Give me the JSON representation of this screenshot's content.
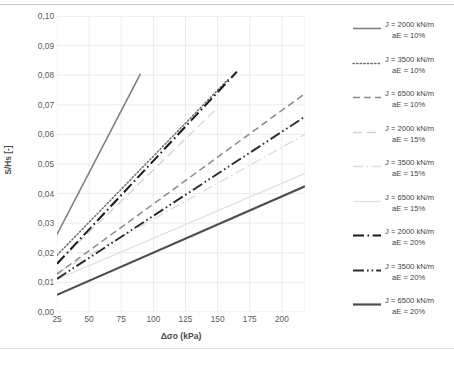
{
  "chart_data": {
    "type": "line",
    "title": "",
    "xlabel": "Δσo (kPa)",
    "ylabel": "S/Hs [-]",
    "xlim": [
      25,
      218
    ],
    "ylim": [
      0.0,
      0.1
    ],
    "xticks": [
      25,
      50,
      75,
      100,
      125,
      150,
      175,
      200
    ],
    "xtick_labels": [
      "25",
      "50",
      "75",
      "100",
      "125",
      "150",
      "175",
      "200"
    ],
    "yticks": [
      0.0,
      0.01,
      0.02,
      0.03,
      0.04,
      0.05,
      0.06,
      0.07,
      0.08,
      0.09,
      0.1
    ],
    "ytick_labels": [
      "0,00",
      "0,01",
      "0,02",
      "0,03",
      "0,04",
      "0,05",
      "0,06",
      "0,07",
      "0,08",
      "0,09",
      "0,10"
    ],
    "grid": true,
    "legend_position": "right",
    "series": [
      {
        "name": "J = 2000 kN/m aE = 10%",
        "label_line1": "J = 2000 kN/m",
        "label_line2": "aE = 10%",
        "style": "solid",
        "color": "#808080",
        "width": 1.6,
        "x": [
          25,
          90
        ],
        "y": [
          0.0262,
          0.0805
        ]
      },
      {
        "name": "J = 3500 kN/m aE = 10%",
        "label_line1": "J = 3500 kN/m",
        "label_line2": "aE = 10%",
        "style": "dotted",
        "color": "#6e6e6e",
        "width": 1.5,
        "x": [
          25,
          158
        ],
        "y": [
          0.0192,
          0.0785
        ]
      },
      {
        "name": "J = 6500 kN/m aE = 10%",
        "label_line1": "J = 6500 kN/m",
        "label_line2": "aE = 10%",
        "style": "dashed",
        "color": "#8a8a8a",
        "width": 1.5,
        "x": [
          25,
          218
        ],
        "y": [
          0.0128,
          0.0738
        ]
      },
      {
        "name": "J = 2000 kN/m aE = 15%",
        "label_line1": "J = 2000 kN/m",
        "label_line2": "aE = 15%",
        "style": "longdash-faint",
        "color": "#d2d2d2",
        "width": 1.3,
        "x": [
          25,
          150
        ],
        "y": [
          0.0165,
          0.069
        ]
      },
      {
        "name": "J = 3500 kN/m aE = 15%",
        "label_line1": "J = 3500 kN/m",
        "label_line2": "aE = 15%",
        "style": "dashdot-faint",
        "color": "#dcdcdc",
        "width": 1.3,
        "x": [
          25,
          218
        ],
        "y": [
          0.0132,
          0.06
        ]
      },
      {
        "name": "J = 6500 kN/m aE = 15%",
        "label_line1": "J = 6500 kN/m",
        "label_line2": "aE = 15%",
        "style": "faint-solid",
        "color": "#e2e2e2",
        "width": 1.3,
        "x": [
          25,
          218
        ],
        "y": [
          0.011,
          0.0468
        ]
      },
      {
        "name": "J = 2000 kN/m aE = 20%",
        "label_line1": "J = 2000 kN/m",
        "label_line2": "aE = 20%",
        "style": "dashdot",
        "color": "#1a1a1a",
        "width": 2.0,
        "x": [
          25,
          165
        ],
        "y": [
          0.0163,
          0.0812
        ]
      },
      {
        "name": "J = 3500 kN/m aE = 20%",
        "label_line1": "J = 3500 kN/m",
        "label_line2": "aE = 20%",
        "style": "dashdotdot",
        "color": "#2b2b2b",
        "width": 1.9,
        "x": [
          25,
          218
        ],
        "y": [
          0.0112,
          0.066
        ]
      },
      {
        "name": "J = 6500 kN/m aE = 20%",
        "label_line1": "J = 6500 kN/m",
        "label_line2": "aE = 20%",
        "style": "solid",
        "color": "#4d4d4d",
        "width": 2.2,
        "x": [
          25,
          218
        ],
        "y": [
          0.0058,
          0.0425
        ]
      }
    ]
  }
}
